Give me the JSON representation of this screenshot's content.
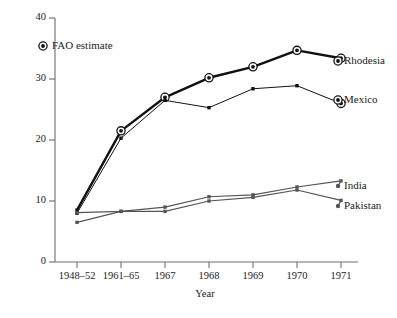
{
  "chart_data": {
    "type": "line",
    "title": "",
    "xlabel": "Year",
    "ylabel": "",
    "categories": [
      "1948-52",
      "1961-65",
      "1967",
      "1968",
      "1969",
      "1970",
      "1971"
    ],
    "xtick_labels": [
      "1948–52",
      "1961–65",
      "1967",
      "1968",
      "1969",
      "1970",
      "1971"
    ],
    "ytick_labels": [
      "0",
      "10",
      "20",
      "30",
      "40"
    ],
    "ytick_values": [
      0,
      10,
      20,
      30,
      40
    ],
    "ylim": [
      0,
      40
    ],
    "grid": false,
    "legend_position": "upper-left",
    "legend_entries": [
      "FAO estimate"
    ],
    "series_labels_position": "right-of-line-end",
    "series": [
      {
        "name": "Rhodesia",
        "label": "Rhodesia",
        "color": "#111111",
        "line_width": 2.4,
        "values": [
          8.5,
          21.5,
          27.0,
          30.2,
          32.0,
          34.7,
          33.4
        ],
        "fao_estimate_points": [
          false,
          true,
          true,
          true,
          true,
          true,
          true
        ]
      },
      {
        "name": "Mexico",
        "label": "Mexico",
        "color": "#111111",
        "line_width": 1.0,
        "values": [
          8.0,
          20.3,
          26.5,
          25.3,
          28.4,
          28.9,
          26.0
        ],
        "fao_estimate_points": [
          false,
          false,
          false,
          false,
          false,
          false,
          true
        ]
      },
      {
        "name": "India",
        "label": "India",
        "color": "#555555",
        "line_width": 1.2,
        "values": [
          8.1,
          8.3,
          9.0,
          10.7,
          11.0,
          12.3,
          13.3
        ],
        "fao_estimate_points": [
          false,
          false,
          false,
          false,
          false,
          false,
          false
        ]
      },
      {
        "name": "Pakistan",
        "label": "Pakistan",
        "color": "#555555",
        "line_width": 1.2,
        "values": [
          6.5,
          8.3,
          8.3,
          10.0,
          10.6,
          11.8,
          10.1
        ],
        "fao_estimate_points": [
          false,
          false,
          false,
          false,
          false,
          false,
          false
        ]
      }
    ]
  },
  "legend": {
    "fao_label": "FAO estimate"
  },
  "axes": {
    "x_title": "Year",
    "y_ticks": [
      "40",
      "30",
      "20",
      "10",
      "0"
    ],
    "x_ticks": [
      "1948–52",
      "1961–65",
      "1967",
      "1968",
      "1969",
      "1970",
      "1971"
    ]
  },
  "labels": {
    "rhodesia": "Rhodesia",
    "mexico": "Mexico",
    "india": "India",
    "pakistan": "Pakistan"
  },
  "colors": {
    "axis": "#6e6e6e",
    "dark_series": "#111111",
    "gray_series": "#555555",
    "text": "#1b1b1b",
    "background": "#ffffff"
  }
}
